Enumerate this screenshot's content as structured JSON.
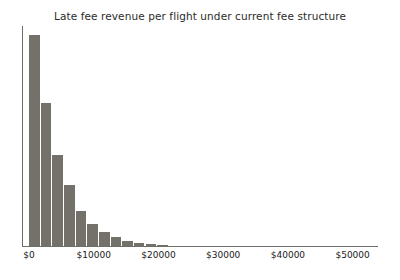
{
  "chart_data": {
    "type": "bar",
    "title": "Late fee revenue per flight under current fee structure",
    "xlabel": "",
    "ylabel": "",
    "xlim": [
      0,
      55000
    ],
    "ylim": [
      0,
      220
    ],
    "grid": false,
    "legend": null,
    "bar_color": "#74706a",
    "axis_color": "#6f6f69",
    "text_color": "#1a1a1a",
    "bin_width": 1800,
    "categories": [
      "0",
      "1800",
      "3600",
      "5400",
      "7200",
      "9000",
      "10800",
      "12600",
      "14400",
      "16200",
      "18000",
      "19800"
    ],
    "values": [
      211,
      143,
      91,
      61,
      35,
      22,
      14,
      9,
      5,
      3,
      2,
      1
    ],
    "xticks": [
      0,
      10000,
      20000,
      30000,
      40000,
      50000
    ],
    "xticklabels": [
      "$0",
      "$10000",
      "$20000",
      "$30000",
      "$40000",
      "$50000"
    ],
    "yticks": [],
    "yticklabels": []
  }
}
